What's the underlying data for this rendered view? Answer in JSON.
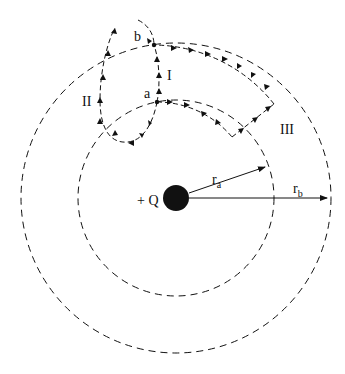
{
  "diagram": {
    "charge_label": "+ Q",
    "radius_a_label": "r",
    "radius_a_sub": "a",
    "radius_b_label": "r",
    "radius_b_sub": "b",
    "point_a_label": "a",
    "point_b_label": "b",
    "path_labels": [
      "I",
      "II",
      "III"
    ],
    "colors": {
      "ink": "#111111",
      "background": "#ffffff"
    }
  }
}
